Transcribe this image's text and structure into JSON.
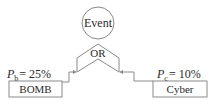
{
  "diagram": {
    "type": "fault-tree",
    "top_event": {
      "label": "Event"
    },
    "gate": {
      "label": "OR"
    },
    "inputs": [
      {
        "label": "BOMB",
        "prob_symbol": "P",
        "prob_subscript": "b",
        "prob_value": "= 25%"
      },
      {
        "label": "Cyber",
        "prob_symbol": "P",
        "prob_subscript": "c",
        "prob_value": "= 10%"
      }
    ],
    "colors": {
      "line": "#8a8a8a",
      "text": "#2a2a2a"
    }
  }
}
